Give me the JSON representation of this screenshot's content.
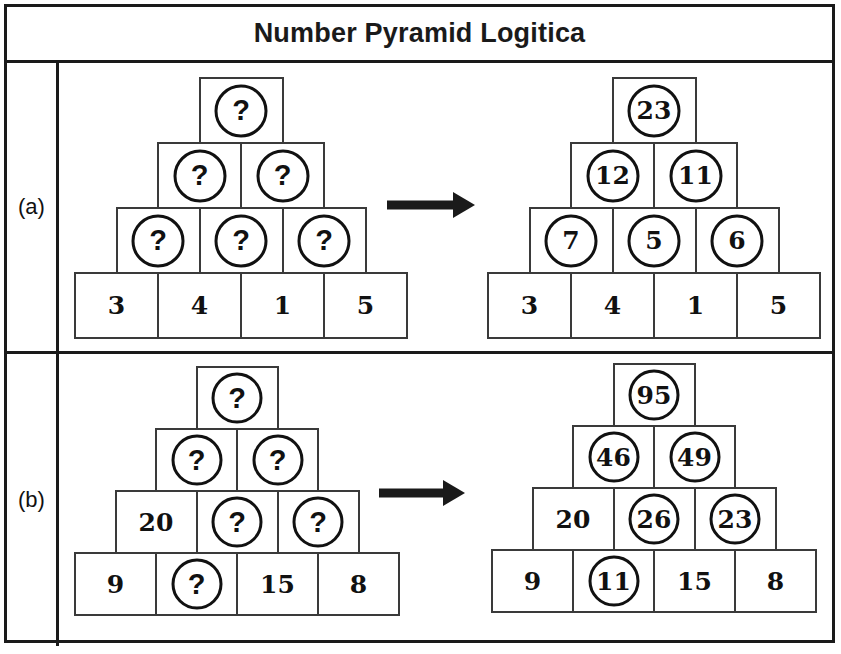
{
  "header": {
    "title": "Number Pyramid Logitica"
  },
  "rows": [
    {
      "label": "(a)",
      "puzzle": {
        "caption": "unsolved-pyramid",
        "levels": [
          {
            "cells": [
              {
                "text": "?",
                "circled": true
              }
            ]
          },
          {
            "cells": [
              {
                "text": "?",
                "circled": true
              },
              {
                "text": "?",
                "circled": true
              }
            ]
          },
          {
            "cells": [
              {
                "text": "?",
                "circled": true
              },
              {
                "text": "?",
                "circled": true
              },
              {
                "text": "?",
                "circled": true
              }
            ]
          },
          {
            "cells": [
              {
                "text": "3",
                "circled": false
              },
              {
                "text": "4",
                "circled": false
              },
              {
                "text": "1",
                "circled": false
              },
              {
                "text": "5",
                "circled": false
              }
            ]
          }
        ]
      },
      "solution": {
        "caption": "solved-pyramid",
        "levels": [
          {
            "cells": [
              {
                "text": "23",
                "circled": true
              }
            ]
          },
          {
            "cells": [
              {
                "text": "12",
                "circled": true
              },
              {
                "text": "11",
                "circled": true
              }
            ]
          },
          {
            "cells": [
              {
                "text": "7",
                "circled": true
              },
              {
                "text": "5",
                "circled": true
              },
              {
                "text": "6",
                "circled": true
              }
            ]
          },
          {
            "cells": [
              {
                "text": "3",
                "circled": false
              },
              {
                "text": "4",
                "circled": false
              },
              {
                "text": "1",
                "circled": false
              },
              {
                "text": "5",
                "circled": false
              }
            ]
          }
        ]
      },
      "arrow": "right-arrow"
    },
    {
      "label": "(b)",
      "puzzle": {
        "caption": "unsolved-pyramid",
        "levels": [
          {
            "cells": [
              {
                "text": "?",
                "circled": true
              }
            ]
          },
          {
            "cells": [
              {
                "text": "?",
                "circled": true
              },
              {
                "text": "?",
                "circled": true
              }
            ]
          },
          {
            "cells": [
              {
                "text": "20",
                "circled": false
              },
              {
                "text": "?",
                "circled": true
              },
              {
                "text": "?",
                "circled": true
              }
            ]
          },
          {
            "cells": [
              {
                "text": "9",
                "circled": false
              },
              {
                "text": "?",
                "circled": true
              },
              {
                "text": "15",
                "circled": false
              },
              {
                "text": "8",
                "circled": false
              }
            ]
          }
        ]
      },
      "solution": {
        "caption": "solved-pyramid",
        "levels": [
          {
            "cells": [
              {
                "text": "95",
                "circled": true
              }
            ]
          },
          {
            "cells": [
              {
                "text": "46",
                "circled": true
              },
              {
                "text": "49",
                "circled": true
              }
            ]
          },
          {
            "cells": [
              {
                "text": "20",
                "circled": false
              },
              {
                "text": "26",
                "circled": true
              },
              {
                "text": "23",
                "circled": true
              }
            ]
          },
          {
            "cells": [
              {
                "text": "9",
                "circled": false
              },
              {
                "text": "11",
                "circled": true
              },
              {
                "text": "15",
                "circled": false
              },
              {
                "text": "8",
                "circled": false
              }
            ]
          }
        ]
      },
      "arrow": "right-arrow"
    }
  ],
  "style": {
    "frame_color": "#1a1a1a",
    "cell_border_color": "#3a3a3a",
    "circle_color": "#111111",
    "arrow_color": "#1a1a1a",
    "background": "#ffffff"
  }
}
